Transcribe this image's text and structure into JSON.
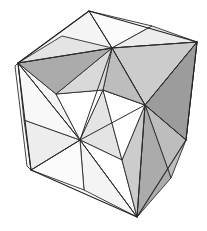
{
  "figure": {
    "background_color": "#ffffff",
    "stroke_color": "#2b2b2b",
    "canvas": {
      "width": 207,
      "height": 231
    }
  },
  "palette": {
    "white": "#ffffff",
    "near_white": "#fbfbfb",
    "lightest": "#f4f4f4",
    "lighter": "#ededed",
    "light": "#e4e4e4",
    "light_mid": "#d9d9d9",
    "mid": "#cccccc",
    "mid_dark": "#bdbdbd",
    "dark": "#ababab",
    "darker": "#9c9c9c",
    "darkest": "#8e8e8e",
    "stroke": "#2b2b2b"
  },
  "geometry": {
    "projection": "oblique",
    "vertices": {
      "top": [
        89,
        11
      ],
      "upper_right": [
        197,
        42
      ],
      "left": [
        18,
        63
      ],
      "mid_right": [
        186,
        140
      ],
      "front_center": [
        80,
        140
      ],
      "lower_left": [
        31,
        170
      ],
      "bottom": [
        137,
        217
      ],
      "top_hub": [
        112,
        48
      ],
      "right_hub": [
        145,
        105
      ],
      "front_hub": [
        80,
        140
      ]
    },
    "faces": [
      {
        "name": "top-face",
        "hub": [
          112,
          48
        ],
        "triangle_count": 8
      },
      {
        "name": "right-face",
        "hub": [
          145,
          105
        ],
        "triangle_count": 8
      },
      {
        "name": "front-face",
        "hub": [
          80,
          140
        ],
        "triangle_count": 8
      }
    ]
  },
  "facets": {
    "top_face": [
      {
        "name": "top-facet-1",
        "points": "89,11 18,63 112,48",
        "fill": "#f4f4f4"
      },
      {
        "name": "top-facet-2",
        "points": "89,11 112,48 152,26",
        "fill": "#fbfbfb"
      },
      {
        "name": "top-facet-3",
        "points": "152,26 112,48 197,42",
        "fill": "#ededed"
      },
      {
        "name": "top-facet-4",
        "points": "197,42 112,48 145,105",
        "fill": "#cccccc"
      },
      {
        "name": "top-facet-5",
        "points": "145,105 112,48 103,90",
        "fill": "#bdbdbd"
      },
      {
        "name": "top-facet-6",
        "points": "103,90 112,48 56,94",
        "fill": "#d9d9d9"
      },
      {
        "name": "top-facet-7",
        "points": "56,94 112,48 18,63",
        "fill": "#ababab"
      },
      {
        "name": "top-facet-8",
        "points": "18,63 112,48 62,36",
        "fill": "#e4e4e4"
      }
    ],
    "right_face": [
      {
        "name": "right-facet-1",
        "points": "197,42 145,105 186,140",
        "fill": "#9c9c9c"
      },
      {
        "name": "right-facet-2",
        "points": "186,140 145,105 171,178",
        "fill": "#bdbdbd"
      },
      {
        "name": "right-facet-3",
        "points": "171,178 145,105 137,217",
        "fill": "#ababab"
      },
      {
        "name": "right-facet-4",
        "points": "137,217 145,105 122,160",
        "fill": "#cccccc"
      },
      {
        "name": "right-facet-5",
        "points": "122,160 145,105 103,90",
        "fill": "#ffffff"
      },
      {
        "name": "right-facet-6",
        "points": "103,90 145,105 150,70",
        "fill": "#8e8e8e"
      },
      {
        "name": "right-facet-7",
        "points": "150,70 145,105 197,42",
        "fill": "#d9d9d9"
      }
    ],
    "front_face": [
      {
        "name": "front-facet-1",
        "points": "18,63 80,140 56,94",
        "fill": "#f4f4f4"
      },
      {
        "name": "front-facet-2",
        "points": "56,94 80,140 103,90",
        "fill": "#ffffff"
      },
      {
        "name": "front-facet-3",
        "points": "103,90 80,140 122,160",
        "fill": "#e4e4e4"
      },
      {
        "name": "front-facet-4",
        "points": "122,160 80,140 137,217",
        "fill": "#ffffff"
      },
      {
        "name": "front-facet-5",
        "points": "137,217 80,140 84,190",
        "fill": "#f4f4f4"
      },
      {
        "name": "front-facet-6",
        "points": "84,190 80,140 31,170",
        "fill": "#fbfbfb"
      },
      {
        "name": "front-facet-7",
        "points": "31,170 80,140 24,120",
        "fill": "#ededed"
      },
      {
        "name": "front-facet-8",
        "points": "24,120 80,140 18,63",
        "fill": "#f8f8f8"
      }
    ],
    "side_strips": [
      {
        "name": "right-strip-upper",
        "points": "197,42 186,140 183,135 194,46",
        "fill": "#f4f4f4"
      },
      {
        "name": "right-strip-lower",
        "points": "186,140 137,217 135,211 183,135",
        "fill": "#ededed"
      },
      {
        "name": "left-strip",
        "points": "18,63 31,170 27,166 15,66",
        "fill": "#fbfbfb"
      }
    ]
  },
  "edges": {
    "outline": [
      "89,11 197,42",
      "89,11 18,63",
      "18,63 31,170",
      "31,170 137,217",
      "137,217 186,140",
      "186,140 197,42"
    ],
    "internal": [
      "18,63 80,140",
      "197,42 145,105",
      "145,105 80,140",
      "112,48 145,105",
      "112,48 80,140",
      "112,48 18,63",
      "112,48 89,11",
      "112,48 197,42",
      "80,140 137,217",
      "145,105 137,217",
      "145,105 186,140",
      "80,140 31,170"
    ]
  }
}
